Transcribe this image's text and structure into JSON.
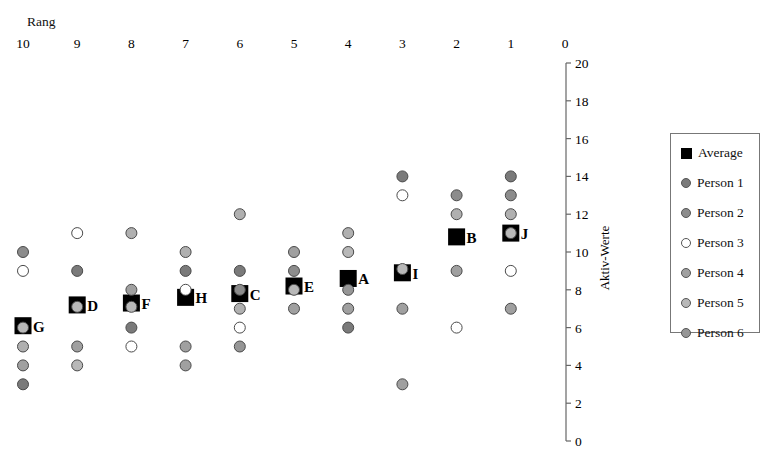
{
  "chart_data": {
    "type": "scatter",
    "title": "",
    "xlabel": "Rang",
    "ylabel": "Aktiv-Werte",
    "x_axis": {
      "position": "top",
      "reversed": true,
      "ticks": [
        "10",
        "9",
        "8",
        "7",
        "6",
        "5",
        "4",
        "3",
        "2",
        "1",
        "0"
      ],
      "range": [
        10,
        0
      ]
    },
    "y_axis": {
      "position": "right",
      "ticks": [
        "0",
        "2",
        "4",
        "6",
        "8",
        "10",
        "12",
        "14",
        "16",
        "18",
        "20"
      ],
      "range": [
        0,
        20
      ]
    },
    "grid": false,
    "legend_position": "right",
    "legend": [
      "Average",
      "Person 1",
      "Person 2",
      "Person 3",
      "Person 4",
      "Person 5",
      "Person 6"
    ],
    "series_styles": {
      "Average": {
        "marker": "square",
        "color": "#000000"
      },
      "Person 1": {
        "marker": "circle",
        "color": "#7a7a7a"
      },
      "Person 2": {
        "marker": "circle",
        "color": "#8c8c8c"
      },
      "Person 3": {
        "marker": "circle",
        "color": "#ffffff"
      },
      "Person 4": {
        "marker": "circle",
        "color": "#a0a0a0"
      },
      "Person 5": {
        "marker": "circle",
        "color": "#b8b8b8"
      },
      "Person 6": {
        "marker": "circle",
        "color": "#969696"
      }
    },
    "items": [
      {
        "label": "G",
        "rank": 10,
        "average": 6.1,
        "points": [
          {
            "v": 10,
            "fill": "#8c8c8c"
          },
          {
            "v": 9,
            "fill": "#ffffff"
          },
          {
            "v": 6,
            "fill": "#b8b8b8"
          },
          {
            "v": 5,
            "fill": "#b0b0b0"
          },
          {
            "v": 4,
            "fill": "#a0a0a0"
          },
          {
            "v": 3,
            "fill": "#7a7a7a"
          }
        ]
      },
      {
        "label": "D",
        "rank": 9,
        "average": 7.2,
        "points": [
          {
            "v": 11,
            "fill": "#ffffff"
          },
          {
            "v": 9,
            "fill": "#7a7a7a"
          },
          {
            "v": 7.1,
            "fill": "#b8b8b8"
          },
          {
            "v": 5,
            "fill": "#a0a0a0"
          },
          {
            "v": 4,
            "fill": "#b8b8b8"
          }
        ]
      },
      {
        "label": "F",
        "rank": 8,
        "average": 7.3,
        "points": [
          {
            "v": 11,
            "fill": "#b0b0b0"
          },
          {
            "v": 8,
            "fill": "#a0a0a0"
          },
          {
            "v": 7.1,
            "fill": "#b8b8b8"
          },
          {
            "v": 6,
            "fill": "#7a7a7a"
          },
          {
            "v": 5,
            "fill": "#ffffff"
          }
        ]
      },
      {
        "label": "H",
        "rank": 7,
        "average": 7.6,
        "points": [
          {
            "v": 10,
            "fill": "#b0b0b0"
          },
          {
            "v": 9,
            "fill": "#7a7a7a"
          },
          {
            "v": 8,
            "fill": "#ffffff"
          },
          {
            "v": 5,
            "fill": "#a0a0a0"
          },
          {
            "v": 4,
            "fill": "#a0a0a0"
          }
        ]
      },
      {
        "label": "C",
        "rank": 6,
        "average": 7.8,
        "points": [
          {
            "v": 12,
            "fill": "#b0b0b0"
          },
          {
            "v": 9,
            "fill": "#7a7a7a"
          },
          {
            "v": 8,
            "fill": "#8c8c8c"
          },
          {
            "v": 7,
            "fill": "#b0b0b0"
          },
          {
            "v": 6,
            "fill": "#ffffff"
          },
          {
            "v": 5,
            "fill": "#969696"
          }
        ]
      },
      {
        "label": "E",
        "rank": 5,
        "average": 8.2,
        "points": [
          {
            "v": 10,
            "fill": "#a0a0a0"
          },
          {
            "v": 9,
            "fill": "#8c8c8c"
          },
          {
            "v": 8,
            "fill": "#b8b8b8"
          },
          {
            "v": 7,
            "fill": "#a0a0a0"
          }
        ]
      },
      {
        "label": "A",
        "rank": 4,
        "average": 8.6,
        "points": [
          {
            "v": 11,
            "fill": "#b0b0b0"
          },
          {
            "v": 10,
            "fill": "#b8b8b8"
          },
          {
            "v": 8,
            "fill": "#969696"
          },
          {
            "v": 7,
            "fill": "#a0a0a0"
          },
          {
            "v": 6,
            "fill": "#7a7a7a"
          }
        ]
      },
      {
        "label": "I",
        "rank": 3,
        "average": 8.9,
        "points": [
          {
            "v": 14,
            "fill": "#7a7a7a"
          },
          {
            "v": 13,
            "fill": "#ffffff"
          },
          {
            "v": 9.1,
            "fill": "#b8b8b8"
          },
          {
            "v": 7,
            "fill": "#a0a0a0"
          },
          {
            "v": 3,
            "fill": "#a0a0a0"
          }
        ]
      },
      {
        "label": "B",
        "rank": 2,
        "average": 10.8,
        "points": [
          {
            "v": 13,
            "fill": "#8c8c8c"
          },
          {
            "v": 12,
            "fill": "#b0b0b0"
          },
          {
            "v": 9,
            "fill": "#a0a0a0"
          },
          {
            "v": 6,
            "fill": "#ffffff"
          }
        ]
      },
      {
        "label": "J",
        "rank": 1,
        "average": 11.0,
        "points": [
          {
            "v": 14,
            "fill": "#7a7a7a"
          },
          {
            "v": 13,
            "fill": "#8c8c8c"
          },
          {
            "v": 12,
            "fill": "#b0b0b0"
          },
          {
            "v": 11,
            "fill": "#b8b8b8"
          },
          {
            "v": 9,
            "fill": "#ffffff"
          },
          {
            "v": 7,
            "fill": "#a0a0a0"
          }
        ]
      }
    ]
  },
  "legend": {
    "items": [
      {
        "label": "Average",
        "marker": "square",
        "color": "#000000"
      },
      {
        "label": "Person 1",
        "marker": "circle",
        "color": "#7a7a7a"
      },
      {
        "label": "Person 2",
        "marker": "circle",
        "color": "#8c8c8c"
      },
      {
        "label": "Person 3",
        "marker": "circle",
        "color": "#ffffff"
      },
      {
        "label": "Person 4",
        "marker": "circle",
        "color": "#a0a0a0"
      },
      {
        "label": "Person 5",
        "marker": "circle",
        "color": "#b8b8b8"
      },
      {
        "label": "Person 6",
        "marker": "circle",
        "color": "#969696"
      }
    ]
  },
  "axes": {
    "x_title": "Rang",
    "y_title": "Aktiv-Werte"
  }
}
